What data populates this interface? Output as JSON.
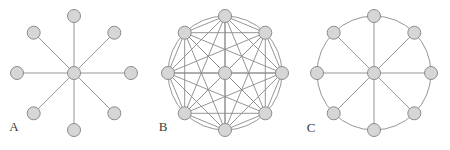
{
  "figure": {
    "background_color": "#ffffff",
    "width": 450,
    "height": 150,
    "node_fill_color": "#d6d6d6",
    "node_stroke_color": "#8c8c8c",
    "edge_color": "#8a8a8a",
    "label_color": "#3a3a3a",
    "node_radius": 6.5,
    "node_stroke_width": 1,
    "edge_width": 0.9
  },
  "panels": [
    {
      "id": "panel-a",
      "label": "A",
      "graph_type": "star",
      "label_position": {
        "x": 14,
        "y": 131
      },
      "center": {
        "x": 74,
        "y": 73
      },
      "ring_radius": 57,
      "node_count": 9,
      "peripheral_count": 8,
      "has_outer_circle": false,
      "has_ring_edges": false,
      "has_chords": false,
      "has_spokes": true,
      "angles_deg": [
        90,
        45,
        0,
        315,
        270,
        225,
        180,
        135
      ],
      "edge_count": 8
    },
    {
      "id": "panel-b",
      "label": "B",
      "graph_type": "complete",
      "label_position": {
        "x": 163,
        "y": 131
      },
      "center": {
        "x": 225,
        "y": 73
      },
      "ring_radius": 57,
      "node_count": 9,
      "peripheral_count": 8,
      "has_outer_circle": true,
      "has_ring_edges": true,
      "has_chords": true,
      "has_spokes": true,
      "angles_deg": [
        90,
        45,
        0,
        315,
        270,
        225,
        180,
        135
      ],
      "edge_count": 36
    },
    {
      "id": "panel-c",
      "label": "C",
      "graph_type": "wheel",
      "label_position": {
        "x": 311,
        "y": 132
      },
      "center": {
        "x": 374,
        "y": 73
      },
      "ring_radius": 57,
      "node_count": 9,
      "peripheral_count": 8,
      "has_outer_circle": true,
      "has_ring_edges": true,
      "has_chords": false,
      "has_spokes": true,
      "angles_deg": [
        90,
        45,
        0,
        315,
        270,
        225,
        180,
        135
      ],
      "edge_count": 16
    }
  ]
}
